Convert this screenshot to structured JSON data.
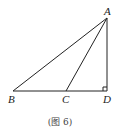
{
  "figure": {
    "caption": "(图 6)",
    "points": {
      "A": {
        "label": "A",
        "x": 107,
        "y": 18
      },
      "B": {
        "label": "B",
        "x": 13,
        "y": 91
      },
      "C": {
        "label": "C",
        "x": 66,
        "y": 91
      },
      "D": {
        "label": "D",
        "x": 107,
        "y": 91
      }
    },
    "segments": [
      "AB",
      "AC",
      "AD",
      "BD"
    ],
    "right_angle_at": "D",
    "line_color": "#222222"
  }
}
